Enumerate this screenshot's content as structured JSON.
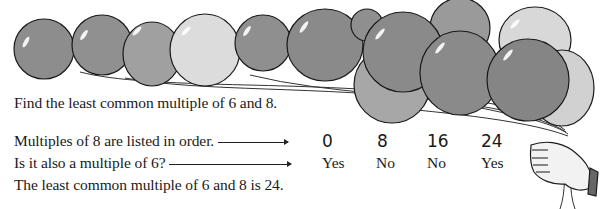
{
  "problem": {
    "prompt": "Find the least common multiple of 6 and 8.",
    "row1_label": "Multiples of 8 are listed in order.",
    "row2_label": "Is it also a multiple of 6?",
    "conclusion": "The least common multiple of 6 and 8 is 24."
  },
  "table": {
    "multiples": [
      "0",
      "8",
      "16",
      "24"
    ],
    "is_multiple_of_6": [
      "Yes",
      "No",
      "No",
      "Yes"
    ]
  },
  "illustration": {
    "subject": "bunch of balloons held by a gloved hand",
    "balloon_colors": [
      "#8a8a8a",
      "#9a9a9a",
      "#a4a4a4",
      "#d6d6d6",
      "#c9c9c9"
    ]
  }
}
